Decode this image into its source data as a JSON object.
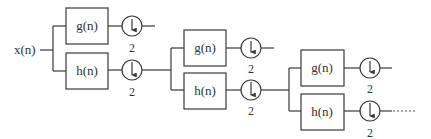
{
  "diagram": {
    "input_label": "x(n)",
    "stages": [
      {
        "lowpass": {
          "label": "g(n)",
          "downsample": "2"
        },
        "highpass": {
          "label": "h(n)",
          "downsample": "2"
        }
      },
      {
        "lowpass": {
          "label": "g(n)",
          "downsample": "2"
        },
        "highpass": {
          "label": "h(n)",
          "downsample": "2"
        }
      },
      {
        "lowpass": {
          "label": "g(n)",
          "downsample": "2"
        },
        "highpass": {
          "label": "h(n)",
          "downsample": "2"
        }
      }
    ],
    "continuation": "......",
    "downsample_symbol": "down-arrow-in-circle",
    "colors": {
      "stroke": "#3a3a3a",
      "text": "#333333",
      "background": "#ffffff"
    }
  }
}
